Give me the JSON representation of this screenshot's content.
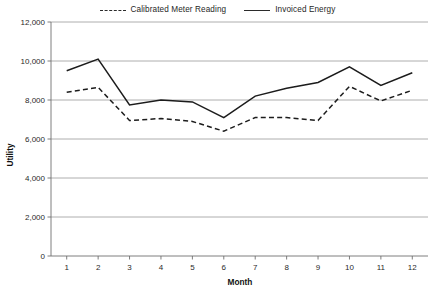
{
  "chart_data": {
    "type": "line",
    "title": "",
    "xlabel": "Month",
    "ylabel": "Utility",
    "categories": [
      "1",
      "2",
      "3",
      "4",
      "5",
      "6",
      "7",
      "8",
      "9",
      "10",
      "11",
      "12"
    ],
    "x": [
      1,
      2,
      3,
      4,
      5,
      6,
      7,
      8,
      9,
      10,
      11,
      12
    ],
    "xlim": [
      0.5,
      12.5
    ],
    "ylim": [
      0,
      12000
    ],
    "yticks": [
      0,
      2000,
      4000,
      6000,
      8000,
      10000,
      12000
    ],
    "ytick_labels": [
      "0",
      "2,000",
      "4,000",
      "6,000",
      "8,000",
      "10,000",
      "12,000"
    ],
    "grid": true,
    "grid_axis": "y",
    "legend_position": "top-center",
    "series": [
      {
        "name": "Calibrated Meter Reading",
        "style": "dashed",
        "color": "#1c1c1c",
        "values": [
          8400,
          8650,
          6950,
          7050,
          6900,
          6400,
          7100,
          7100,
          6950,
          8700,
          7950,
          8500
        ]
      },
      {
        "name": "Invoiced Energy",
        "style": "solid",
        "color": "#1c1c1c",
        "values": [
          9500,
          10100,
          7750,
          8000,
          7900,
          7100,
          8200,
          8600,
          8900,
          9700,
          8750,
          9400
        ]
      }
    ]
  },
  "legend": {
    "items": [
      {
        "label": "Calibrated Meter Reading",
        "style": "dashed"
      },
      {
        "label": "Invoiced Energy",
        "style": "solid"
      }
    ]
  },
  "axes": {
    "y_title": "Utility",
    "x_title": "Month"
  }
}
